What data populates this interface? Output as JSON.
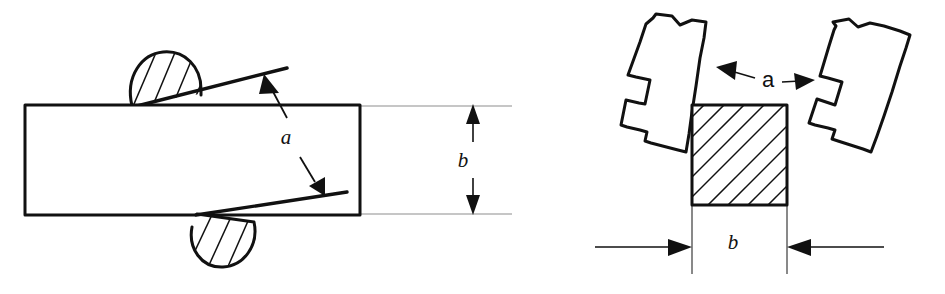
{
  "figure": {
    "background_color": "#ffffff",
    "line_color": "#111111",
    "extension_line_color": "#8d8d8d",
    "width": 945,
    "height": 294
  },
  "left_diagram": {
    "name": "side-view-plate-with-rollers",
    "plate": {
      "label": "workpiece-plate",
      "x": 25,
      "y": 105,
      "width": 335,
      "height": 110
    },
    "upper_roller": {
      "label": "upper-roller-dome",
      "hatch_count": 4
    },
    "lower_roller": {
      "label": "lower-roller-dome",
      "hatch_count": 4
    },
    "angle_label": "a",
    "thickness_label": "b",
    "angle_label_position": {
      "x": 293,
      "y": 143
    },
    "thickness_label_position": {
      "x": 462,
      "y": 166
    }
  },
  "right_diagram": {
    "name": "end-view-jaws-with-specimen",
    "specimen": {
      "label": "hatched-specimen-square",
      "x": 692,
      "y": 105,
      "width": 95,
      "height": 100,
      "hatch_count": 12
    },
    "left_jaw": {
      "label": "left-gripper-jaw",
      "tilt_degrees": 12
    },
    "right_jaw": {
      "label": "right-gripper-jaw",
      "tilt_degrees": -12
    },
    "angle_label": "a",
    "width_label": "b",
    "angle_label_position": {
      "x": 768,
      "y": 86
    },
    "width_label_position": {
      "x": 733,
      "y": 248
    }
  },
  "labels": {
    "a": "a",
    "b": "b"
  }
}
